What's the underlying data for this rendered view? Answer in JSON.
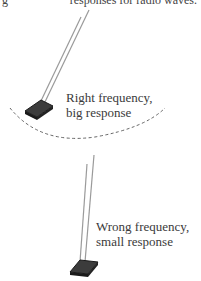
{
  "caption": {
    "left_fragment": "g",
    "right_fragment": "responses for radio waves."
  },
  "panels": [
    {
      "label_line1": "Right frequency,",
      "label_line2": "big response"
    },
    {
      "label_line1": "Wrong frequency,",
      "label_line2": "small response"
    }
  ],
  "colors": {
    "antenna": "#9a9a9a",
    "base_fill": "#3c3c3c",
    "base_edge": "#1a1a1a",
    "dashed_arc": "#555555",
    "text": "#3a3a3a"
  }
}
